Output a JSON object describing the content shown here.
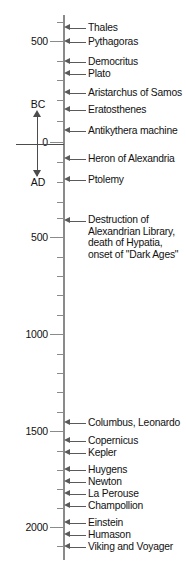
{
  "figure": {
    "type": "timeline",
    "orientation": "vertical",
    "axis_color": "#8a8a8a",
    "text_color": "#111111",
    "arrow_color": "#5a5a5a"
  },
  "era_indicator": {
    "upper_label": "BC",
    "lower_label": "AD",
    "description": "double-headed vertical arrow marking BC above and AD below year zero"
  },
  "axis": {
    "major_ticks": [
      {
        "label": "500",
        "year": -500,
        "y": 41
      },
      {
        "label": "0",
        "year": 0,
        "y": 142
      },
      {
        "label": "500",
        "year": 500,
        "y": 237
      },
      {
        "label": "1000",
        "year": 1000,
        "y": 334
      },
      {
        "label": "1500",
        "year": 1500,
        "y": 431
      },
      {
        "label": "2000",
        "year": 2000,
        "y": 527
      }
    ],
    "minor_ticks_y": [
      22,
      61,
      80,
      100,
      121,
      162,
      182,
      202,
      218,
      257,
      276,
      295,
      315,
      354,
      373,
      392,
      412,
      451,
      470,
      489,
      508,
      546
    ]
  },
  "chart_data": {
    "type": "timeline",
    "axis_label_top": "BC",
    "axis_label_bottom": "AD",
    "ylim": [
      -620,
      2100
    ],
    "ytick_labels": [
      "500",
      "0",
      "500",
      "1000",
      "1500",
      "2000"
    ],
    "events": [
      {
        "label": "Thales",
        "y": 28,
        "approx_year": -600
      },
      {
        "label": "Pythagoras",
        "y": 42,
        "approx_year": -530
      },
      {
        "label": "Democritus",
        "y": 62,
        "approx_year": -430
      },
      {
        "label": "Plato",
        "y": 74,
        "approx_year": -400
      },
      {
        "label": "Aristarchus of Samos",
        "y": 93,
        "approx_year": -280
      },
      {
        "label": "Eratosthenes",
        "y": 110,
        "approx_year": -230
      },
      {
        "label": "Antikythera machine",
        "y": 131,
        "approx_year": -80
      },
      {
        "label": "Heron of Alexandria",
        "y": 159,
        "approx_year": 60
      },
      {
        "label": "Ptolemy",
        "y": 180,
        "approx_year": 150
      },
      {
        "label": "Destruction of Alexandrian Library, death of Hypatia, onset of \"Dark Ages\"",
        "y": 221,
        "approx_year": 415,
        "multiline": true
      },
      {
        "label": "Columbus, Leonardo",
        "y": 423,
        "approx_year": 1490
      },
      {
        "label": "Copernicus",
        "y": 441,
        "approx_year": 1540
      },
      {
        "label": "Kepler",
        "y": 453,
        "approx_year": 1610
      },
      {
        "label": "Huygens",
        "y": 470,
        "approx_year": 1660
      },
      {
        "label": "Newton",
        "y": 482,
        "approx_year": 1690
      },
      {
        "label": "La Perouse",
        "y": 494,
        "approx_year": 1785
      },
      {
        "label": "Champollion",
        "y": 506,
        "approx_year": 1822
      },
      {
        "label": "Einstein",
        "y": 523,
        "approx_year": 1915
      },
      {
        "label": "Humason",
        "y": 535,
        "approx_year": 1930
      },
      {
        "label": "Viking and Voyager",
        "y": 547,
        "approx_year": 1977
      }
    ]
  }
}
